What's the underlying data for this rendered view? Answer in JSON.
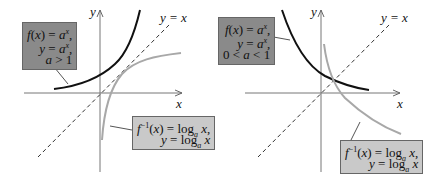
{
  "left_graph": {
    "y_axis_label": "y",
    "x_axis_label": "x",
    "line_label": "y = x",
    "exp_box": [
      "f(x) = a^x,",
      "y = a^x,",
      "a > 1"
    ],
    "log_box": [
      "f⁻¹(x) = log_a x,",
      "y = log_a x"
    ]
  },
  "right_graph": {
    "y_axis_label": "y",
    "x_axis_label": "x",
    "line_label": "y = x",
    "exp_box": [
      "f(x) = a^x,",
      "y = a^x,",
      "0 < a < 1"
    ],
    "log_box": [
      "f⁻¹(x) = log_a x,",
      "y = log_a x"
    ]
  },
  "colors": {
    "exp_curve": "#111111",
    "log_curve": "#a8a8a8",
    "exp_box_bg": "#8a8a8a",
    "log_box_bg": "#c9c9c9"
  }
}
